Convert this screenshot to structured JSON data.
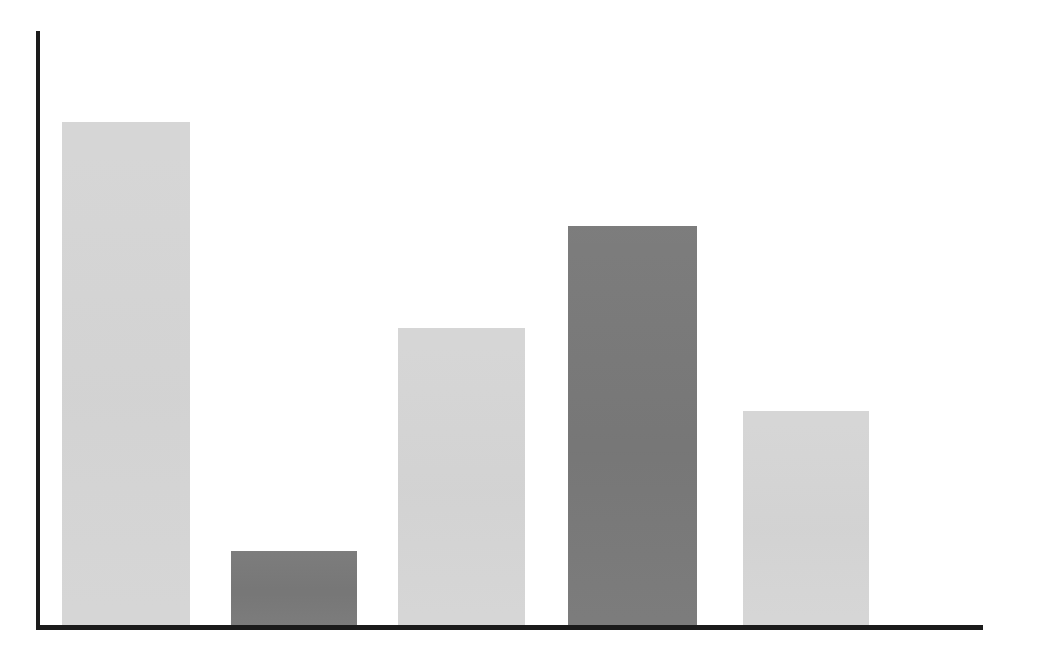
{
  "chart_data": {
    "type": "bar",
    "title": "",
    "subtitle": "",
    "xlabel": "",
    "ylabel": "",
    "categories": [
      "1",
      "2",
      "3",
      "4",
      "5"
    ],
    "values": [
      503,
      74,
      297,
      399,
      214
    ],
    "values_normalized_pct": [
      100.0,
      14.7,
      59.0,
      79.3,
      42.5
    ],
    "ylim": [
      0,
      594
    ],
    "grid": false,
    "legend": false,
    "legend_position": "none",
    "tick_labels_x": [],
    "tick_labels_y": [],
    "annotations": [],
    "series": [
      {
        "name": "values",
        "values": [
          503,
          74,
          297,
          399,
          214
        ]
      }
    ],
    "bars": [
      {
        "category": "1",
        "value": 503,
        "height_pct": 100.0,
        "color_key": "light",
        "x_px": 62,
        "width_px": 128,
        "top_px": 122
      },
      {
        "category": "2",
        "value": 74,
        "height_pct": 14.7,
        "color_key": "dark",
        "x_px": 231,
        "width_px": 126,
        "top_px": 551
      },
      {
        "category": "3",
        "value": 297,
        "height_pct": 59.0,
        "color_key": "light",
        "x_px": 398,
        "width_px": 127,
        "top_px": 328
      },
      {
        "category": "4",
        "value": 399,
        "height_pct": 79.3,
        "color_key": "dark",
        "x_px": 568,
        "width_px": 129,
        "top_px": 226
      },
      {
        "category": "5",
        "value": 214,
        "height_pct": 42.5,
        "color_key": "light",
        "x_px": 743,
        "width_px": 126,
        "top_px": 411
      }
    ]
  },
  "colors": {
    "background": "#ffffff",
    "axis": "#1b1b1b",
    "light": "#d5d5d5",
    "dark": "#787878"
  },
  "axes": {
    "y_axis": {
      "x_px": 36,
      "top_px": 31,
      "width_px": 4,
      "height_px": 598
    },
    "x_axis": {
      "x_px": 36,
      "y_px": 625,
      "width_px": 947,
      "height_px": 5
    },
    "baseline_px": 625
  }
}
